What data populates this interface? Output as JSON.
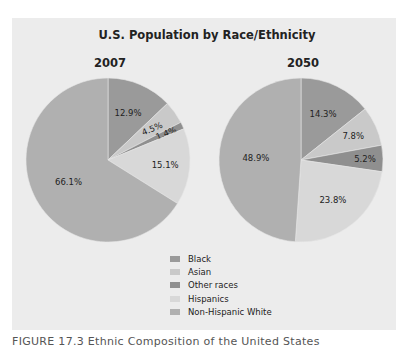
{
  "chart_data": [
    {
      "type": "pie",
      "title": "U.S. Population by Race/Ethnicity",
      "subtitle": "2007",
      "categories": [
        "Black",
        "Asian",
        "Other races",
        "Hispanics",
        "Non-Hispanic White"
      ],
      "values": [
        12.9,
        4.5,
        1.4,
        15.1,
        66.1
      ],
      "labels": [
        "12.9%",
        "4.5%",
        "1.4%",
        "15.1%",
        "66.1%"
      ],
      "colors": [
        "#9a9a9a",
        "#c9c9c9",
        "#8f8f8f",
        "#d8d8d8",
        "#b0b0b0"
      ]
    },
    {
      "type": "pie",
      "title": "U.S. Population by Race/Ethnicity",
      "subtitle": "2050",
      "categories": [
        "Black",
        "Asian",
        "Other races",
        "Hispanics",
        "Non-Hispanic White"
      ],
      "values": [
        14.3,
        7.8,
        5.2,
        23.8,
        48.9
      ],
      "labels": [
        "14.3%",
        "7.8%",
        "5.2%",
        "23.8%",
        "48.9%"
      ],
      "colors": [
        "#9a9a9a",
        "#c9c9c9",
        "#8f8f8f",
        "#d8d8d8",
        "#b0b0b0"
      ]
    }
  ],
  "chart": {
    "title": "U.S. Population by Race/Ethnicity",
    "year_left": "2007",
    "year_right": "2050"
  },
  "legend": {
    "items": [
      {
        "label": "Black",
        "color": "#9a9a9a"
      },
      {
        "label": "Asian",
        "color": "#c9c9c9"
      },
      {
        "label": "Other races",
        "color": "#8f8f8f"
      },
      {
        "label": "Hispanics",
        "color": "#d8d8d8"
      },
      {
        "label": "Non-Hispanic White",
        "color": "#b0b0b0"
      }
    ]
  },
  "caption": "FIGURE 17.3   Ethnic Composition of the United States"
}
